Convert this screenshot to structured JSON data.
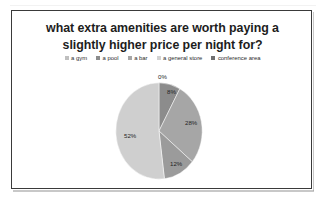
{
  "chart_data": {
    "type": "pie",
    "title": "what extra amenities are worth paying a slightly higher price per night for?",
    "title_line1": "what extra amenities are worth paying a",
    "title_line2": "slightly higher price per night for?",
    "categories": [
      "a gym",
      "a pool",
      "a bar",
      "a general store",
      "conference area"
    ],
    "values": [
      0,
      8,
      28,
      12,
      52
    ],
    "value_labels": [
      "0%",
      "8%",
      "28%",
      "12%",
      "52%"
    ],
    "unit": "%",
    "legend_position": "top",
    "grid": false,
    "colors": [
      "#d9d9d9",
      "#8c8c8c",
      "#a6a6a6",
      "#9b9b9b",
      "#cfcfcf"
    ],
    "slices": [
      {
        "label": "a gym",
        "value": 0,
        "display": "0%",
        "color": "#d9d9d9",
        "label_placement": "outside-top"
      },
      {
        "label": "a pool",
        "value": 8,
        "display": "8%",
        "color": "#8c8c8c",
        "label_placement": "inside"
      },
      {
        "label": "a bar",
        "value": 28,
        "display": "28%",
        "color": "#a6a6a6",
        "label_placement": "inside"
      },
      {
        "label": "a general store",
        "value": 12,
        "display": "12%",
        "color": "#9b9b9b",
        "label_placement": "inside"
      },
      {
        "label": "conference area",
        "value": 52,
        "display": "52%",
        "color": "#cfcfcf",
        "label_placement": "inside"
      }
    ]
  },
  "legend": {
    "items": [
      {
        "label": "a gym",
        "color": "#bfbfbf"
      },
      {
        "label": "a pool",
        "color": "#8c8c8c"
      },
      {
        "label": "a bar",
        "color": "#a6a6a6"
      },
      {
        "label": "a general store",
        "color": "#d2d2d2"
      },
      {
        "label": "conference area",
        "color": "#6f6f6f"
      }
    ]
  }
}
